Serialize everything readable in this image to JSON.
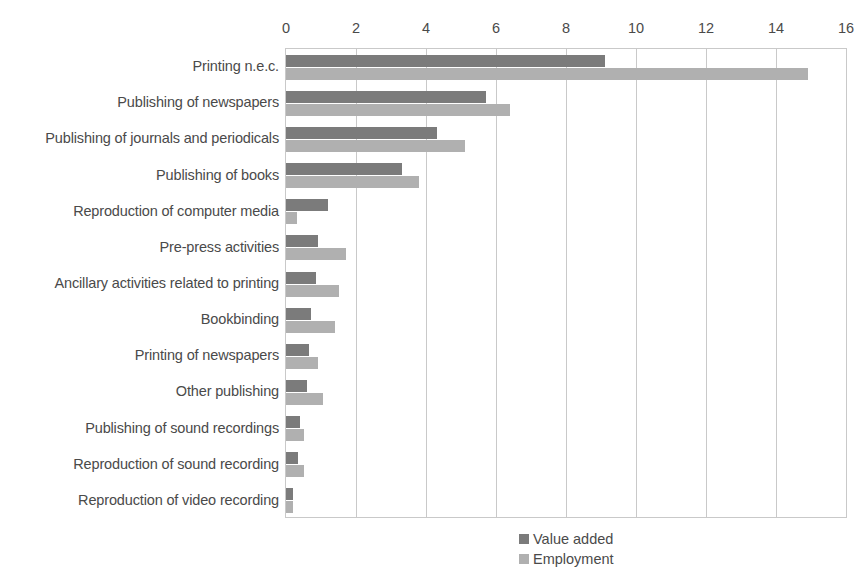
{
  "chart_data": {
    "type": "bar",
    "orientation": "horizontal",
    "title": "",
    "xlabel": "",
    "ylabel": "",
    "xlim": [
      0,
      16
    ],
    "xticks": [
      0,
      2,
      4,
      6,
      8,
      10,
      12,
      14,
      16
    ],
    "grid": true,
    "legend_position": "bottom-center",
    "categories": [
      "Printing n.e.c.",
      "Publishing of newspapers",
      "Publishing of journals and periodicals",
      "Publishing of books",
      "Reproduction of computer media",
      "Pre-press activities",
      "Ancillary activities related to printing",
      "Bookbinding",
      "Printing of newspapers",
      "Other publishing",
      "Publishing of sound recordings",
      "Reproduction of sound recording",
      "Reproduction of video recording"
    ],
    "series": [
      {
        "name": "Value added",
        "color": "#7b7b7b",
        "values": [
          9.1,
          5.7,
          4.3,
          3.3,
          1.2,
          0.9,
          0.85,
          0.7,
          0.65,
          0.6,
          0.4,
          0.35,
          0.2
        ]
      },
      {
        "name": "Employment",
        "color": "#b0b0b0",
        "values": [
          14.9,
          6.4,
          5.1,
          3.8,
          0.3,
          1.7,
          1.5,
          1.4,
          0.9,
          1.05,
          0.5,
          0.5,
          0.2
        ]
      }
    ]
  },
  "legend": {
    "items": [
      {
        "label": "Value added",
        "color": "#7b7b7b"
      },
      {
        "label": "Employment",
        "color": "#b0b0b0"
      }
    ]
  }
}
